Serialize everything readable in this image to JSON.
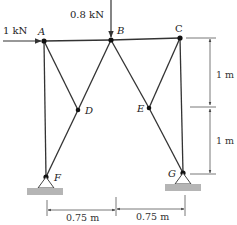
{
  "diagram": {
    "type": "truss",
    "nodes": [
      {
        "id": "A",
        "label": "A",
        "x": 44,
        "y": 41
      },
      {
        "id": "B",
        "label": "B",
        "x": 111,
        "y": 40
      },
      {
        "id": "C",
        "label": "C",
        "x": 180,
        "y": 38
      },
      {
        "id": "D",
        "label": "D",
        "x": 78,
        "y": 110
      },
      {
        "id": "E",
        "label": "E",
        "x": 149,
        "y": 108
      },
      {
        "id": "F",
        "label": "F",
        "x": 46,
        "y": 177
      },
      {
        "id": "G",
        "label": "G",
        "x": 183,
        "y": 173
      }
    ],
    "members": [
      [
        "A",
        "B"
      ],
      [
        "B",
        "C"
      ],
      [
        "A",
        "F"
      ],
      [
        "A",
        "D"
      ],
      [
        "D",
        "F"
      ],
      [
        "B",
        "D"
      ],
      [
        "B",
        "E"
      ],
      [
        "E",
        "G"
      ],
      [
        "C",
        "E"
      ],
      [
        "C",
        "G"
      ]
    ],
    "loads": [
      {
        "node": "A",
        "label": "1 kN",
        "direction": "right"
      },
      {
        "node": "B",
        "label": "0.8 kN",
        "direction": "down"
      }
    ],
    "supports": [
      {
        "node": "F",
        "type": "pin"
      },
      {
        "node": "G",
        "type": "pin"
      }
    ],
    "dimensions": {
      "vertical": [
        {
          "label": "1 m",
          "from": "C",
          "to": "E-level"
        },
        {
          "label": "1 m",
          "from": "E-level",
          "to": "G"
        }
      ],
      "horizontal": [
        {
          "label": "0.75 m",
          "from": "F",
          "to": "B"
        },
        {
          "label": "0.75 m",
          "from": "B",
          "to": "G"
        }
      ]
    }
  }
}
